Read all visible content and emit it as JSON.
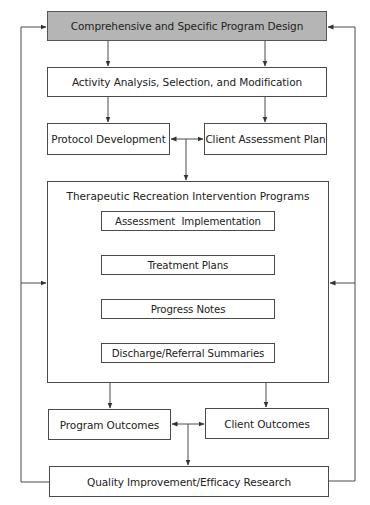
{
  "diagram": {
    "type": "flowchart",
    "colors": {
      "top_box_fill": "#b5b5b5",
      "line": "#4a4a4a",
      "background": "#ffffff"
    },
    "nodes": {
      "program_design": "Comprehensive and Specific Program Design",
      "activity_analysis": "Activity Analysis, Selection, and Modification",
      "protocol_development": "Protocol Development",
      "client_assessment_plan": "Client Assessment Plan",
      "tr_intervention_programs": "Therapeutic Recreation Intervention Programs",
      "assessment_implementation": "Assessment  Implementation",
      "treatment_plans": "Treatment Plans",
      "progress_notes": "Progress Notes",
      "discharge_referral": "Discharge/Referral Summaries",
      "program_outcomes": "Program Outcomes",
      "client_outcomes": "Client Outcomes",
      "quality_improvement": "Quality Improvement/Efficacy Research"
    },
    "edges": [
      {
        "from": "program_design",
        "to": "activity_analysis",
        "count": 2
      },
      {
        "from": "activity_analysis",
        "to": "protocol_development"
      },
      {
        "from": "activity_analysis",
        "to": "client_assessment_plan"
      },
      {
        "from": "protocol_development",
        "to": "client_assessment_plan",
        "bidirectional": true
      },
      {
        "from": "protocol_development|client_assessment_plan",
        "to": "tr_intervention_programs"
      },
      {
        "from": "assessment_implementation",
        "to": "treatment_plans"
      },
      {
        "from": "treatment_plans",
        "to": "progress_notes"
      },
      {
        "from": "progress_notes",
        "to": "discharge_referral"
      },
      {
        "from": "tr_intervention_programs",
        "to": "program_outcomes"
      },
      {
        "from": "tr_intervention_programs",
        "to": "client_outcomes"
      },
      {
        "from": "program_outcomes",
        "to": "client_outcomes",
        "bidirectional": true
      },
      {
        "from": "program_outcomes|client_outcomes",
        "to": "quality_improvement"
      },
      {
        "from": "quality_improvement",
        "to": "program_design",
        "side": "left"
      },
      {
        "from": "quality_improvement",
        "to": "program_design",
        "side": "right"
      },
      {
        "from": "left_loop",
        "to": "tr_intervention_programs"
      },
      {
        "from": "right_loop",
        "to": "tr_intervention_programs"
      }
    ]
  }
}
